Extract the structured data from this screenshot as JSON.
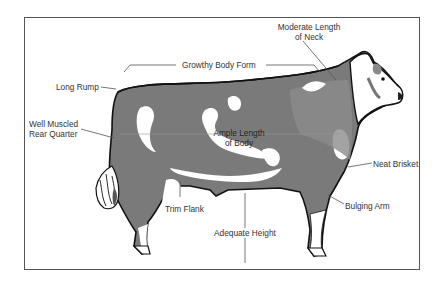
{
  "diagram": {
    "colors": {
      "frame": "#555555",
      "outline": "#111111",
      "dark_patch": "#6e6e6e",
      "mid_patch": "#8a8a8a",
      "white": "#ffffff",
      "label_text": "#333333",
      "leader_line": "#666666"
    },
    "labels": {
      "neck_line1": "Moderate Length",
      "neck_line2": "of Neck",
      "body_form": "Growthy Body Form",
      "rump": "Long Rump",
      "rear_line1": "Well Muscled",
      "rear_line2": "Rear Quarter",
      "body_line1": "Ample Length",
      "body_line2": "of Body",
      "brisket": "Neat Brisket",
      "flank": "Trim Flank",
      "arm": "Bulging Arm",
      "height": "Adequate Height"
    }
  }
}
